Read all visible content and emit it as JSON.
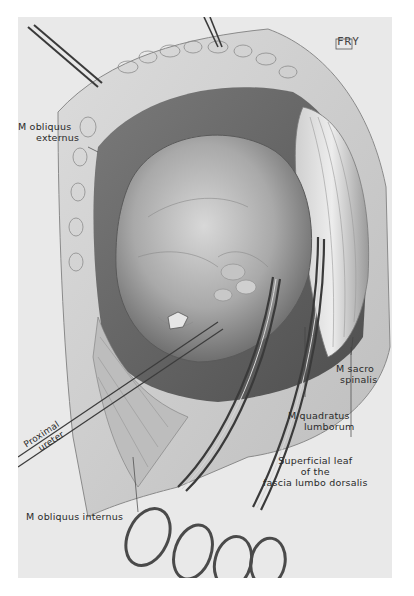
{
  "illustration": {
    "subject": "Surgical exposure of kidney through lumbar incision",
    "style": "grayscale anatomical drawing",
    "signature": "FRY",
    "labels": {
      "obliquus_externus_1": "M obliquus",
      "obliquus_externus_2": "externus",
      "sacro_spinalis_1": "M sacro",
      "sacro_spinalis_2": "spinalis",
      "quadratus_1": "M quadratus",
      "quadratus_2": "lumborum",
      "fascia_1": "Superficial leaf",
      "fascia_2": "of    the",
      "fascia_3": "fascia lumbo dorsalis",
      "ureter_1": "Proximal",
      "ureter_2": "ureter",
      "obliquus_internus": "M obliquus internus"
    },
    "colors": {
      "background": "#ffffff",
      "plate": "#e9e9e9",
      "ink": "#2a2a2a",
      "shadow": "#5a5a5a"
    }
  }
}
